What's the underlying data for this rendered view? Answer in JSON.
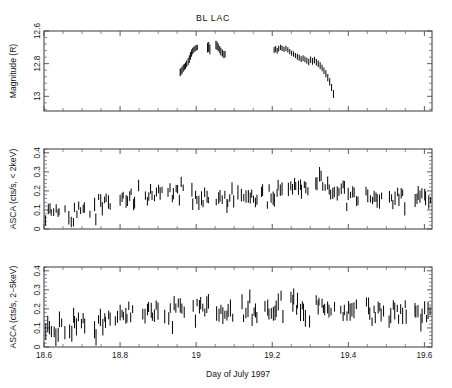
{
  "figure": {
    "title": "BL LAC",
    "width": 452,
    "height": 388,
    "background": "#ffffff",
    "data_color": "#0d0d0d",
    "axis_color": "#4a4a4a"
  },
  "xaxis": {
    "label": "Day of July 1997",
    "min": 18.6,
    "max": 19.62,
    "ticks": [
      18.6,
      18.8,
      19,
      19.2,
      19.4,
      19.6
    ],
    "tick_labels": [
      "18.6",
      "18.8",
      "19",
      "19.2",
      "19.4",
      "19.6"
    ],
    "minor_per_major": 4
  },
  "chart_data": [
    {
      "type": "scatter",
      "panel": 1,
      "title": "BL LAC",
      "xlabel": "",
      "ylabel": "Magnitude (R)",
      "xlim": [
        18.6,
        19.62
      ],
      "ylim": [
        13.09,
        12.6
      ],
      "inverted_y": true,
      "yticks": [
        12.6,
        12.8,
        13
      ],
      "ytick_labels": [
        "12.6",
        "12.8",
        "13"
      ],
      "grid": false,
      "legend": false,
      "errorbars": true,
      "series": [
        {
          "name": "R magnitude",
          "x": [
            18.958,
            18.96,
            18.963,
            18.966,
            18.969,
            18.972,
            18.975,
            18.979,
            18.982,
            18.985,
            18.988,
            18.991,
            18.994,
            18.997,
            19.0,
            19.003,
            19.03,
            19.033,
            19.036,
            19.052,
            19.055,
            19.058,
            19.062,
            19.065,
            19.069,
            19.073,
            19.076,
            19.205,
            19.209,
            19.213,
            19.217,
            19.222,
            19.226,
            19.231,
            19.236,
            19.241,
            19.246,
            19.251,
            19.256,
            19.261,
            19.266,
            19.271,
            19.276,
            19.281,
            19.286,
            19.291,
            19.296,
            19.301,
            19.306,
            19.311,
            19.316,
            19.321,
            19.326,
            19.331,
            19.336,
            19.341,
            19.346,
            19.351,
            19.356,
            19.361
          ],
          "y": [
            12.855,
            12.848,
            12.84,
            12.828,
            12.82,
            12.812,
            12.8,
            12.788,
            12.772,
            12.752,
            12.735,
            12.722,
            12.714,
            12.708,
            12.703,
            12.7,
            12.702,
            12.698,
            12.712,
            12.686,
            12.69,
            12.7,
            12.714,
            12.726,
            12.736,
            12.745,
            12.742,
            12.716,
            12.71,
            12.722,
            12.708,
            12.7,
            12.706,
            12.712,
            12.706,
            12.716,
            12.726,
            12.736,
            12.742,
            12.75,
            12.758,
            12.764,
            12.772,
            12.766,
            12.774,
            12.782,
            12.79,
            12.776,
            12.786,
            12.778,
            12.792,
            12.8,
            12.812,
            12.826,
            12.844,
            12.862,
            12.886,
            12.912,
            12.946,
            12.986
          ],
          "yerr": [
            0.022,
            0.022,
            0.022,
            0.022,
            0.02,
            0.02,
            0.02,
            0.022,
            0.024,
            0.024,
            0.022,
            0.02,
            0.018,
            0.018,
            0.018,
            0.016,
            0.03,
            0.03,
            0.03,
            0.026,
            0.026,
            0.024,
            0.022,
            0.024,
            0.022,
            0.022,
            0.02,
            0.018,
            0.018,
            0.018,
            0.018,
            0.016,
            0.016,
            0.016,
            0.016,
            0.016,
            0.016,
            0.016,
            0.016,
            0.016,
            0.018,
            0.018,
            0.018,
            0.018,
            0.018,
            0.018,
            0.02,
            0.02,
            0.02,
            0.02,
            0.02,
            0.02,
            0.02,
            0.02,
            0.02,
            0.022,
            0.022,
            0.022,
            0.022,
            0.024
          ]
        }
      ]
    },
    {
      "type": "scatter",
      "panel": 2,
      "title": "",
      "xlabel": "",
      "ylabel": "ASCA (cts/s, < 2keV)",
      "xlim": [
        18.6,
        19.62
      ],
      "ylim": [
        0,
        0.42
      ],
      "inverted_y": false,
      "yticks": [
        0,
        0.1,
        0.2,
        0.3,
        0.4
      ],
      "ytick_labels": [
        "0",
        "0.1",
        "0.2",
        "0.3",
        "0.4"
      ],
      "grid": false,
      "legend": false,
      "errorbars": true,
      "series": [
        {
          "name": "ASCA soft band < 2 keV",
          "baseline": [
            [
              18.6,
              0.105
            ],
            [
              18.64,
              0.098
            ],
            [
              18.68,
              0.096
            ],
            [
              18.72,
              0.1
            ],
            [
              18.76,
              0.14
            ],
            [
              18.8,
              0.155
            ],
            [
              18.84,
              0.175
            ],
            [
              18.88,
              0.185
            ],
            [
              18.92,
              0.172
            ],
            [
              18.96,
              0.2
            ],
            [
              19.0,
              0.185
            ],
            [
              19.04,
              0.178
            ],
            [
              19.08,
              0.17
            ],
            [
              19.12,
              0.175
            ],
            [
              19.16,
              0.185
            ],
            [
              19.2,
              0.185
            ],
            [
              19.24,
              0.205
            ],
            [
              19.28,
              0.215
            ],
            [
              19.32,
              0.24
            ],
            [
              19.36,
              0.2
            ],
            [
              19.4,
              0.175
            ],
            [
              19.44,
              0.16
            ],
            [
              19.48,
              0.165
            ],
            [
              19.52,
              0.168
            ],
            [
              19.56,
              0.17
            ],
            [
              19.6,
              0.17
            ]
          ],
          "scatter_sigma": 0.028,
          "yerr_typical": 0.026,
          "n_points": 200,
          "seed": 7
        }
      ]
    },
    {
      "type": "scatter",
      "panel": 3,
      "title": "",
      "xlabel": "Day of July 1997",
      "ylabel": "ASCA (cts/s, 2−5keV)",
      "xlim": [
        18.6,
        19.62
      ],
      "ylim": [
        0,
        0.42
      ],
      "inverted_y": false,
      "yticks": [
        0,
        0.1,
        0.2,
        0.3,
        0.4
      ],
      "ytick_labels": [
        "0",
        "0.1",
        "0.2",
        "0.3",
        "0.4"
      ],
      "grid": false,
      "legend": false,
      "errorbars": true,
      "series": [
        {
          "name": "ASCA hard band 2−5 keV",
          "baseline": [
            [
              18.6,
              0.095
            ],
            [
              18.64,
              0.105
            ],
            [
              18.68,
              0.105
            ],
            [
              18.72,
              0.11
            ],
            [
              18.76,
              0.14
            ],
            [
              18.8,
              0.155
            ],
            [
              18.84,
              0.18
            ],
            [
              18.88,
              0.19
            ],
            [
              18.92,
              0.175
            ],
            [
              18.96,
              0.195
            ],
            [
              19.0,
              0.2
            ],
            [
              19.04,
              0.195
            ],
            [
              19.08,
              0.18
            ],
            [
              19.12,
              0.19
            ],
            [
              19.16,
              0.195
            ],
            [
              19.2,
              0.19
            ],
            [
              19.24,
              0.205
            ],
            [
              19.28,
              0.2
            ],
            [
              19.32,
              0.21
            ],
            [
              19.36,
              0.205
            ],
            [
              19.4,
              0.18
            ],
            [
              19.44,
              0.17
            ],
            [
              19.48,
              0.172
            ],
            [
              19.52,
              0.18
            ],
            [
              19.56,
              0.185
            ],
            [
              19.6,
              0.188
            ]
          ],
          "scatter_sigma": 0.03,
          "yerr_typical": 0.032,
          "n_points": 200,
          "seed": 23
        }
      ]
    }
  ],
  "panels_geometry": {
    "left": 44,
    "right": 432,
    "panel_tops": [
      31,
      149,
      267
    ],
    "panel_height": 80
  }
}
